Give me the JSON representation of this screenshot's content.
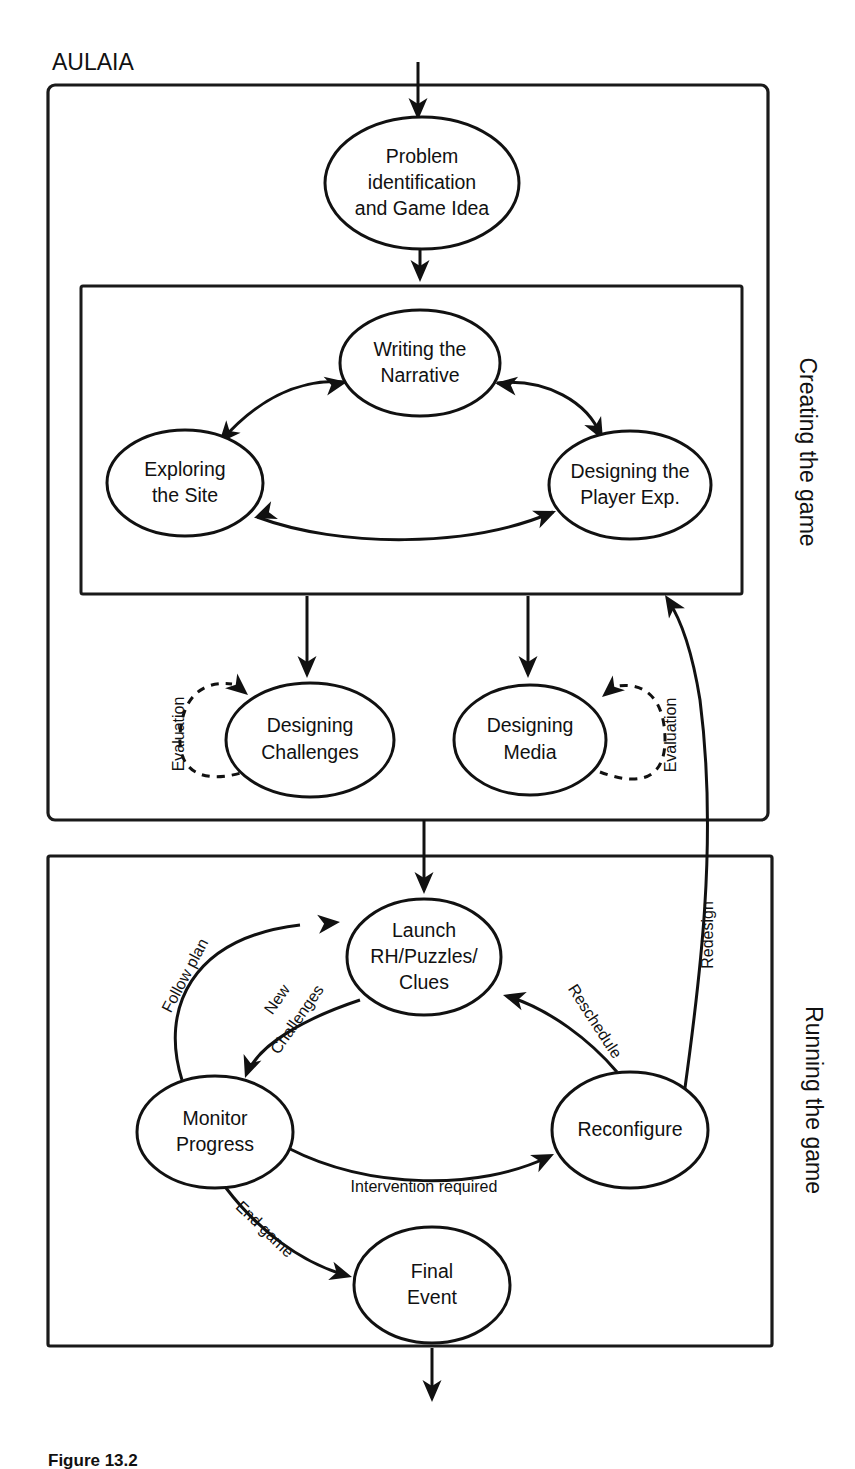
{
  "figure": {
    "title": "AULAIA",
    "caption": "Figure 13.2",
    "sections": [
      {
        "id": "creating",
        "label": "Creating the game"
      },
      {
        "id": "running",
        "label": "Running the game"
      }
    ],
    "nodes": [
      {
        "id": "problem",
        "lines": [
          "Problem",
          "identification",
          "and Game Idea"
        ]
      },
      {
        "id": "writing",
        "lines": [
          "Writing the",
          "Narrative"
        ]
      },
      {
        "id": "exploring",
        "lines": [
          "Exploring",
          "the Site"
        ]
      },
      {
        "id": "player-exp",
        "lines": [
          "Designing the",
          "Player Exp."
        ]
      },
      {
        "id": "challenges",
        "lines": [
          "Designing",
          "Challenges"
        ]
      },
      {
        "id": "media",
        "lines": [
          "Designing",
          "Media"
        ]
      },
      {
        "id": "launch",
        "lines": [
          "Launch",
          "RH/Puzzles/",
          "Clues"
        ]
      },
      {
        "id": "monitor",
        "lines": [
          "Monitor",
          "Progress"
        ]
      },
      {
        "id": "reconfigure",
        "lines": [
          "Reconfigure"
        ]
      },
      {
        "id": "final",
        "lines": [
          "Final",
          "Event"
        ]
      }
    ],
    "edge_labels": [
      {
        "id": "eval-left",
        "text": "Evaluation"
      },
      {
        "id": "eval-right",
        "text": "Evaluation"
      },
      {
        "id": "redesign",
        "text": "Redesign"
      },
      {
        "id": "follow-plan",
        "text": "Follow plan"
      },
      {
        "id": "new-challenges-1",
        "text": "New"
      },
      {
        "id": "new-challenges-2",
        "text": "Challenges"
      },
      {
        "id": "reschedule",
        "text": "Reschedule"
      },
      {
        "id": "intervention",
        "text": "Intervention required"
      },
      {
        "id": "end-game",
        "text": "End game"
      }
    ],
    "colors": {
      "stroke": "#111111",
      "background": "#ffffff"
    }
  }
}
